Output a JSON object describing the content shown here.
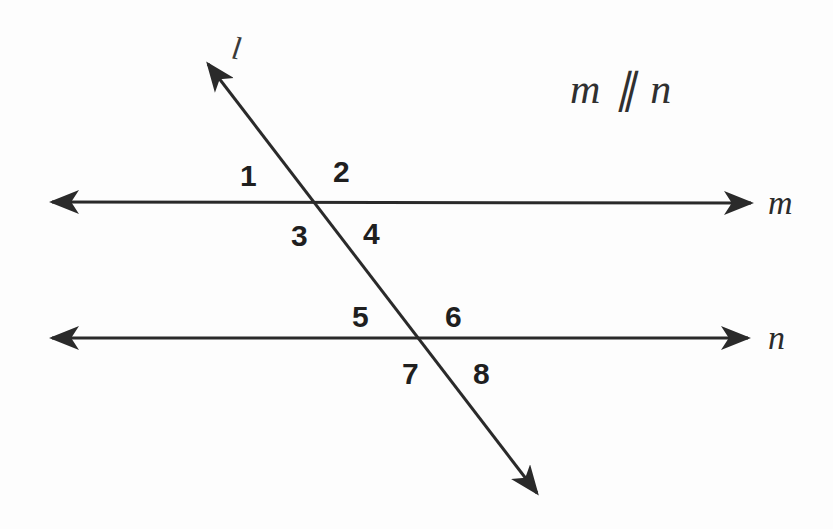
{
  "figure": {
    "kind": "geometry-diagram",
    "background_color": "#fdfdfd",
    "stroke_color": "#2a2a2a",
    "stroke_width": 3,
    "statement": {
      "text": "m ∥ n",
      "x": 570,
      "y": 68
    },
    "lines": [
      {
        "name": "m",
        "label": "m",
        "label_x": 768,
        "label_y": 186,
        "x1": 48,
        "y1": 202,
        "x2": 755,
        "y2": 203,
        "arrow_start": true,
        "arrow_end": true
      },
      {
        "name": "n",
        "label": "n",
        "label_x": 768,
        "label_y": 321,
        "x1": 48,
        "y1": 338,
        "x2": 752,
        "y2": 338,
        "arrow_start": true,
        "arrow_end": true
      },
      {
        "name": "l",
        "label": "l",
        "label_x": 232,
        "label_y": 32,
        "x1": 205,
        "y1": 60,
        "x2": 540,
        "y2": 497,
        "arrow_start": true,
        "arrow_end": true
      }
    ],
    "intersections": [
      {
        "lines": "l-m",
        "x": 318,
        "y": 202
      },
      {
        "lines": "l-n",
        "x": 418,
        "y": 337
      }
    ],
    "angle_labels": [
      {
        "id": "angle-1",
        "text": "1",
        "x": 240,
        "y": 161
      },
      {
        "id": "angle-2",
        "text": "2",
        "x": 333,
        "y": 157
      },
      {
        "id": "angle-3",
        "text": "3",
        "x": 291,
        "y": 221
      },
      {
        "id": "angle-4",
        "text": "4",
        "x": 363,
        "y": 219
      },
      {
        "id": "angle-5",
        "text": "5",
        "x": 352,
        "y": 302
      },
      {
        "id": "angle-6",
        "text": "6",
        "x": 445,
        "y": 302
      },
      {
        "id": "angle-7",
        "text": "7",
        "x": 402,
        "y": 359
      },
      {
        "id": "angle-8",
        "text": "8",
        "x": 473,
        "y": 359
      }
    ]
  }
}
